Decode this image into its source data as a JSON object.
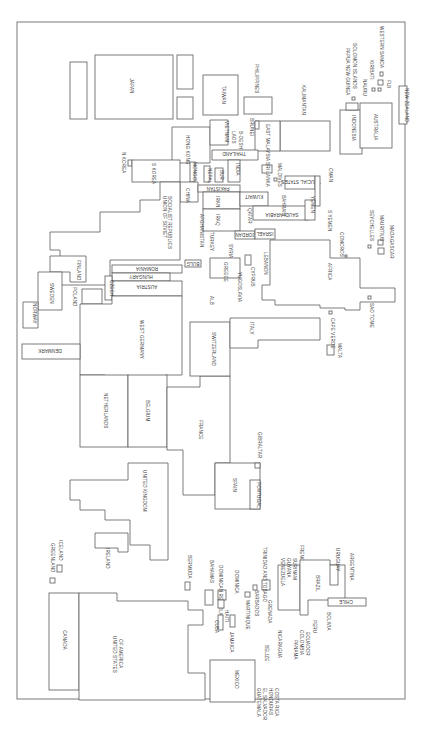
{
  "diagram": {
    "type": "cartogram",
    "orientation": "rotated 90 degrees clockwise",
    "countries": {
      "japan": "JAPAN",
      "taiwan": "TAIWAN",
      "philippines": "PHILIPPINES",
      "kalimantan": "KALIMANTAN",
      "indonesia": "INDONESIA",
      "papua_new_guinea": "PAPUA NEW GUINEA",
      "solomon_islands": "SOLOMON ISLANDS",
      "nauru": "NAURU",
      "kiribati": "KIRIBATI",
      "western_samoa": "WESTERN SAMOA",
      "fiji": "FIJI",
      "australia": "AUSTRALIA",
      "new_zealand": "NEW ZEALAND",
      "hong_kong": "HONG KONG",
      "vietnam": "VIETNAM",
      "laos": "LAOS",
      "bangladesh": "B-DESH",
      "brunei": "BRUNEI",
      "east_malaysia": "EAST MALAYSIA",
      "thailand": "THAILAND",
      "n_korea": "N KOREA",
      "s_korea": "S KOREA",
      "mongolia": "MONGOLIA",
      "nepal": "NEPAL",
      "burma": "BUR",
      "india": "INDIA",
      "sri_lanka": "SRI LANKA",
      "maldives": "MALDIVES",
      "china": "CHINA",
      "pakistan": "PAKISTAN",
      "iran": "IRAN",
      "iraq": "IRAQ",
      "kuwait": "KUWAIT",
      "qatar": "QATAR",
      "bahrain": "BAHRAIN",
      "trucial_states": "TRUCIAL STATES",
      "oman": "OMAN",
      "yemen": "YEMEN",
      "s_yemen": "S YEMEN",
      "saudi_arabia": "SAUDI ARABIA",
      "ussr": "UNION OF SOVIET SOCIALIST REPUBLICS",
      "afghanistan": "AFGHANISTAN",
      "turkey": "TURKEY",
      "syria": "SYRIA",
      "jordan": "JORDAN",
      "israel": "ISRAEL",
      "lebanon": "LEBANON",
      "cyprus": "CYPRUS",
      "greece": "GREECE",
      "bulgaria": "BULG",
      "yugoslavia": "YUGOSLAVIA",
      "albania": "ALB",
      "romania": "ROMANIA",
      "hungary": "HUNGARY",
      "austria": "AUSTRIA",
      "czech": "CZECH",
      "finland": "FINLAND",
      "poland": "POLAND",
      "norway": "NORWAY",
      "sweden": "SWEDEN",
      "east_germany": "EAST GERMANY",
      "west_germany": "WEST GERMANY",
      "denmark": "DENMARK",
      "netherlands": "NETHERLANDS",
      "belgium": "BELGIUM",
      "france": "FRANCE",
      "switzerland": "SWITZERLAND",
      "italy": "ITALY",
      "malta": "MALTA",
      "cape_verde": "CAPE VERDE",
      "africa": "AFRICA",
      "sao_tome": "SAO TOME",
      "comoros": "COMOROS",
      "seychelles": "SEYCHELLES",
      "mauritius": "MAURITIUS",
      "madagascar": "MADAGASCAR",
      "spain": "SPAIN",
      "portugal": "PORTUGAL",
      "gibraltar": "GIBRALTAR",
      "united_kingdom": "UNITED KINGDOM",
      "ireland": "IRELAND",
      "greenland": "GREENLAND",
      "iceland": "ICELAND",
      "canada": "CANADA",
      "usa": "UNITED STATES OF AMERICA",
      "bermuda": "BERMUDA",
      "bahamas": "BAHAMAS",
      "dominican_republic": "DOMINICAN REPUBLIC",
      "dominica": "DOMINICA",
      "haiti": "HAITI",
      "cuba": "CUBA",
      "jamaica": "JAMAICA",
      "martinique": "MARTINIQUE",
      "barbados": "BARBADOS",
      "trinidad": "TRINIDAD AND TOBAGO",
      "grenada": "GRENADA",
      "venezuela": "VENEZUELA",
      "guyana": "GUYANA",
      "surinam": "SURINAM",
      "french_guiana": "FRENCH GUIANA",
      "brazil": "BRAZIL",
      "uruguay": "URUGUAY",
      "argentina": "ARGENTINA",
      "chile": "CHILE",
      "bolivia": "BOLIVIA",
      "peru": "PERU",
      "ecuador": "ECUADOR",
      "colombia": "COLOMBIA",
      "panama": "PANAMA",
      "nicaragua": "NICARAGUA",
      "belize": "BELIZE",
      "mexico": "MEXICO",
      "guatemala": "GUATEMALA",
      "el_salvador": "EL SALVADOR",
      "honduras": "HONDURAS",
      "costa_rica": "COSTA RICA"
    },
    "colors": {
      "stroke": "#5a5a5a",
      "frame": "#7a7a7a",
      "background": "#ffffff",
      "text": "#3a3a3a"
    }
  }
}
